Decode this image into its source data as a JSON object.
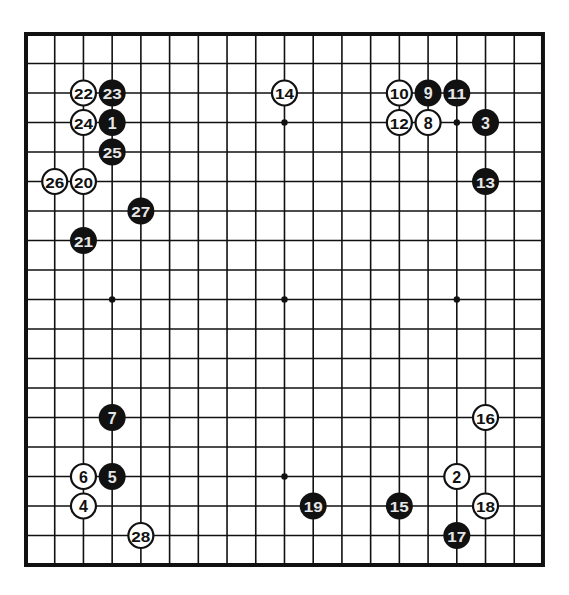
{
  "board": {
    "size": 19,
    "origin_x": 26,
    "origin_y": 34,
    "step_x": 28.72,
    "step_y": 29.5,
    "line_color": "#111111",
    "background": "#ffffff",
    "stone_radius": 13.5,
    "star_points": [
      [
        3,
        3
      ],
      [
        9,
        3
      ],
      [
        15,
        3
      ],
      [
        3,
        9
      ],
      [
        9,
        9
      ],
      [
        15,
        9
      ],
      [
        3,
        15
      ],
      [
        9,
        15
      ],
      [
        15,
        15
      ]
    ]
  },
  "colors": {
    "black_stone": "#111111",
    "black_label": "#e6e6e6",
    "white_stone": "#ffffff",
    "white_label": "#111111"
  },
  "stones": [
    {
      "n": "1",
      "color": "black",
      "col": 3,
      "row": 3
    },
    {
      "n": "2",
      "color": "white",
      "col": 15,
      "row": 15
    },
    {
      "n": "3",
      "color": "black",
      "col": 16,
      "row": 3
    },
    {
      "n": "4",
      "color": "white",
      "col": 2,
      "row": 16
    },
    {
      "n": "5",
      "color": "black",
      "col": 3,
      "row": 15
    },
    {
      "n": "6",
      "color": "white",
      "col": 2,
      "row": 15
    },
    {
      "n": "7",
      "color": "black",
      "col": 3,
      "row": 13
    },
    {
      "n": "8",
      "color": "white",
      "col": 14,
      "row": 3
    },
    {
      "n": "9",
      "color": "black",
      "col": 14,
      "row": 2
    },
    {
      "n": "10",
      "color": "white",
      "col": 13,
      "row": 2
    },
    {
      "n": "11",
      "color": "black",
      "col": 15,
      "row": 2
    },
    {
      "n": "12",
      "color": "white",
      "col": 13,
      "row": 3
    },
    {
      "n": "13",
      "color": "black",
      "col": 16,
      "row": 5
    },
    {
      "n": "14",
      "color": "white",
      "col": 9,
      "row": 2
    },
    {
      "n": "15",
      "color": "black",
      "col": 13,
      "row": 16
    },
    {
      "n": "16",
      "color": "white",
      "col": 16,
      "row": 13
    },
    {
      "n": "17",
      "color": "black",
      "col": 15,
      "row": 17
    },
    {
      "n": "18",
      "color": "white",
      "col": 16,
      "row": 16
    },
    {
      "n": "19",
      "color": "black",
      "col": 10,
      "row": 16
    },
    {
      "n": "20",
      "color": "white",
      "col": 2,
      "row": 5
    },
    {
      "n": "21",
      "color": "black",
      "col": 2,
      "row": 7
    },
    {
      "n": "22",
      "color": "white",
      "col": 2,
      "row": 2
    },
    {
      "n": "23",
      "color": "black",
      "col": 3,
      "row": 2
    },
    {
      "n": "24",
      "color": "white",
      "col": 2,
      "row": 3
    },
    {
      "n": "25",
      "color": "black",
      "col": 3,
      "row": 4
    },
    {
      "n": "26",
      "color": "white",
      "col": 1,
      "row": 5
    },
    {
      "n": "27",
      "color": "black",
      "col": 4,
      "row": 6
    },
    {
      "n": "28",
      "color": "white",
      "col": 4,
      "row": 17
    }
  ]
}
